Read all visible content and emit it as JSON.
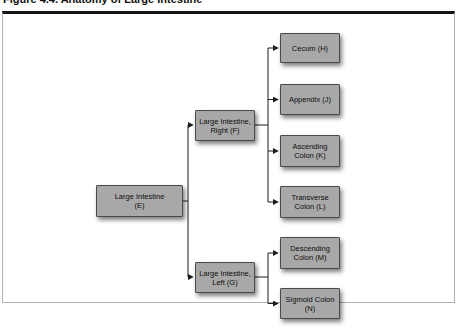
{
  "figure": {
    "caption": "Figure 4.4. Anatomy of Large Intestine"
  },
  "diagram": {
    "type": "hierarchy-flowchart",
    "nodes": {
      "e": {
        "label": "Large Intestine\n(E)"
      },
      "f": {
        "label": "Large Intestine,\nRight (F)"
      },
      "g": {
        "label": "Large Intestine,\nLeft (G)"
      },
      "h": {
        "label": "Cecum (H)"
      },
      "j": {
        "label": "Appendix (J)"
      },
      "k": {
        "label": "Ascending\nColon (K)"
      },
      "l": {
        "label": "Transverse\nColon (L)"
      },
      "m": {
        "label": "Descending\nColon (M)"
      },
      "n": {
        "label": "Sigmoid Colon\n(N)"
      }
    },
    "edges": [
      {
        "from": "Large Intestine (E)",
        "to": "Large Intestine, Right (F)"
      },
      {
        "from": "Large Intestine (E)",
        "to": "Large Intestine, Left (G)"
      },
      {
        "from": "Large Intestine, Right (F)",
        "to": "Cecum (H)"
      },
      {
        "from": "Large Intestine, Right (F)",
        "to": "Appendix (J)"
      },
      {
        "from": "Large Intestine, Right (F)",
        "to": "Ascending Colon (K)"
      },
      {
        "from": "Large Intestine, Right (F)",
        "to": "Transverse Colon (L)"
      },
      {
        "from": "Large Intestine, Left (G)",
        "to": "Descending Colon (M)"
      },
      {
        "from": "Large Intestine, Left (G)",
        "to": "Sigmoid Colon (N)"
      }
    ],
    "colors": {
      "node_fill": "#a8a8a8",
      "node_border": "#4a4a4a",
      "connector": "#1c1c1c",
      "panel_border_top": "#141414",
      "panel_border_sides": "#b2b2b2"
    }
  }
}
